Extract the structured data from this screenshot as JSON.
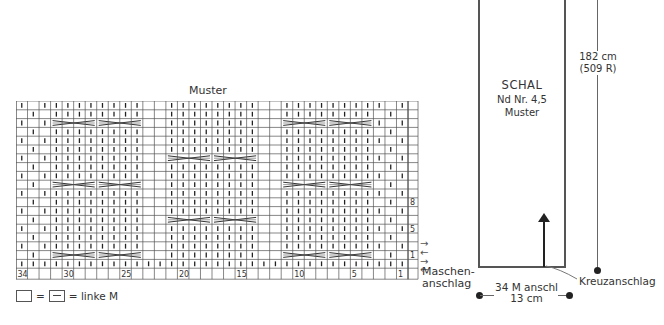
{
  "chart": {
    "title": "Muster",
    "stitches": 34,
    "rows": 19,
    "column_numbers": [
      {
        "label": "34",
        "col": 34
      },
      {
        "label": "30",
        "col": 30
      },
      {
        "label": "25",
        "col": 25
      },
      {
        "label": "20",
        "col": 20
      },
      {
        "label": "15",
        "col": 15
      },
      {
        "label": "10",
        "col": 10
      },
      {
        "label": "5",
        "col": 5
      },
      {
        "label": "1",
        "col": 1
      }
    ],
    "row_numbers": [
      {
        "label": "8",
        "row_from_top": 11
      },
      {
        "label": "5",
        "row_from_top": 14
      },
      {
        "label": "1",
        "row_from_top": 17
      }
    ],
    "panels": [
      {
        "name": "panel-a",
        "start_col_index": 3,
        "width": 8,
        "cable_rows_from_top": [
          2,
          9,
          17
        ]
      },
      {
        "name": "panel-b",
        "start_col_index": 13,
        "width": 8,
        "cable_rows_from_top": [
          6,
          13
        ]
      },
      {
        "name": "panel-c",
        "start_col_index": 23,
        "width": 8,
        "cable_rows_from_top": [
          2,
          9,
          17
        ]
      }
    ],
    "arrows": [
      "→",
      "←",
      "→",
      "←"
    ],
    "cast_on_label_line1": "Maschen-",
    "cast_on_label_line2": "anschlag"
  },
  "legend": {
    "equals1": "=",
    "equals2": "=",
    "text": "= linke M"
  },
  "schematic": {
    "title": "SCHAL",
    "needle": "Nd Nr. 4,5",
    "pattern": "Muster",
    "length": "182 cm",
    "rows": "(509 R)",
    "width_stitches": "34 M anschl",
    "width_cm": "13 cm",
    "cast_on_type": "Kreuzanschlag"
  },
  "colors": {
    "grid": "#555555",
    "text": "#333333",
    "outline": "#555555"
  }
}
